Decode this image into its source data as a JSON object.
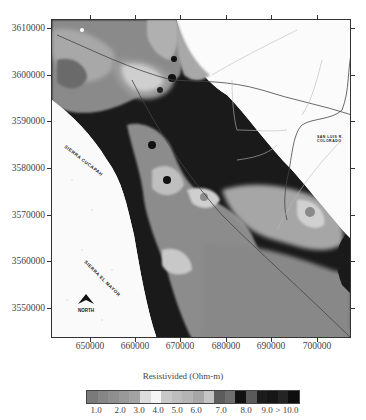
{
  "map": {
    "y_axis": {
      "ticks": [
        "3610000",
        "3600000",
        "3590000",
        "3580000",
        "3570000",
        "3560000",
        "3550000"
      ]
    },
    "x_axis": {
      "ticks": [
        "650000",
        "660000",
        "670000",
        "680000",
        "690000",
        "700000"
      ]
    },
    "labels": {
      "sierra_cucapah": "SIERRA CUCAPAH",
      "sierra_el_mayor": "SIERRA EL MAYOR",
      "san_luis_line1": "SAN LUIS R.",
      "san_luis_line2": "COLORADO",
      "north": "NORTH"
    }
  },
  "legend": {
    "title": "Resistivided (Ohm-m)",
    "tick_labels": [
      "1.0",
      "2.0",
      "3.0",
      "4.0",
      "5.0",
      "6.0",
      "7.0",
      "8.0",
      "9.0",
      "> 10.0"
    ],
    "colors": [
      "#7a7a7a",
      "#868686",
      "#8f8f8f",
      "#999999",
      "#a3a3a3",
      "#dcdcdc",
      "#f6f6f6",
      "#c8c8c8",
      "#bdbdbd",
      "#b4b4b4",
      "#a6a6a6",
      "#c4c4c4",
      "#5c5c5c",
      "#6e6e6e",
      "#111111",
      "#5a5a5a",
      "#1c1c1c",
      "#161616",
      "#242424",
      "#0e0e0e"
    ]
  }
}
